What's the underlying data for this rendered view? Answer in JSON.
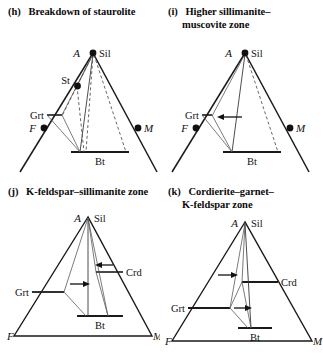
{
  "figure": {
    "type": "afm-ternary-diagram-series",
    "panel_count": 4
  },
  "panels": [
    {
      "id": "h",
      "tag": "(h)",
      "caption_lines": [
        "Breakdown of staurolite"
      ],
      "caption": "(h)  Breakdown of staurolite",
      "vertices": {
        "apex_label": "A",
        "apex_phase": "Sil",
        "left_label": "F",
        "right_label": "M"
      },
      "phase_labels": [
        "St",
        "Grt",
        "Bt"
      ],
      "st_label": "St",
      "grt_label": "Grt",
      "bt_label": "Bt",
      "has_open_triangle": true,
      "has_dashed_tielines": true,
      "has_point_dots": true,
      "arrows": []
    },
    {
      "id": "i",
      "tag": "(i)",
      "caption_lines": [
        "Higher sillimanite–",
        "muscovite zone"
      ],
      "caption": "(i)  Higher sillimanite–muscovite zone",
      "vertices": {
        "apex_label": "A",
        "apex_phase": "Sil",
        "left_label": "F",
        "right_label": "M"
      },
      "phase_labels": [
        "Grt",
        "Bt"
      ],
      "grt_label": "Grt",
      "bt_label": "Bt",
      "has_open_triangle": true,
      "has_dashed_tielines": true,
      "has_point_dots": true,
      "arrows": [
        {
          "label": "",
          "direction": "left",
          "target": "Grt"
        }
      ]
    },
    {
      "id": "j",
      "tag": "(j)",
      "caption_lines": [
        "K-feldspar–sillimanite zone"
      ],
      "caption": "(j)  K-feldspar–sillimanite zone",
      "vertices": {
        "apex_label": "A",
        "apex_phase": "Sil",
        "left_label": "F",
        "right_label": "M"
      },
      "phase_labels": [
        "Grt",
        "Crd",
        "Bt"
      ],
      "grt_label": "Grt",
      "crd_label": "Crd",
      "bt_label": "Bt",
      "has_open_triangle": false,
      "has_dashed_tielines": false,
      "has_point_dots": false,
      "arrows": [
        {
          "label": "",
          "direction": "right",
          "target": "Grt"
        },
        {
          "label": "",
          "direction": "left",
          "target": "Crd"
        }
      ]
    },
    {
      "id": "k",
      "tag": "(k)",
      "caption_lines": [
        "Cordierite–garnet–",
        "K-feldspar  zone"
      ],
      "caption": "(k)  Cordierite–garnet–K-feldspar zone",
      "vertices": {
        "apex_label": "A",
        "apex_phase": "Sil",
        "left_label": "F",
        "right_label": "M"
      },
      "phase_labels": [
        "Grt",
        "Crd",
        "Bt"
      ],
      "grt_label": "Grt",
      "crd_label": "Crd",
      "bt_label": "Bt",
      "has_open_triangle": false,
      "has_dashed_tielines": false,
      "has_point_dots": false,
      "arrows": [
        {
          "label": "",
          "direction": "right",
          "target": "Crd"
        },
        {
          "label": "",
          "direction": "right",
          "target": "Grt"
        }
      ]
    }
  ],
  "colors": {
    "ink": "#111111",
    "line": "#1a1a1a",
    "thin_line": "#4a4a4a",
    "dashed": "#555555",
    "background": "#ffffff"
  }
}
